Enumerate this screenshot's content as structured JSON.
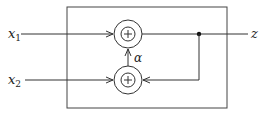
{
  "diagram": {
    "inputs": [
      {
        "name": "x",
        "subscript": "1"
      },
      {
        "name": "x",
        "subscript": "2"
      }
    ],
    "output": {
      "name": "z"
    },
    "gain_label": "α",
    "adders": [
      {
        "id": "adder-top",
        "symbol": "+"
      },
      {
        "id": "adder-bottom",
        "symbol": "+"
      }
    ],
    "colors": {
      "stroke": "#333333",
      "background": "#ffffff"
    }
  }
}
